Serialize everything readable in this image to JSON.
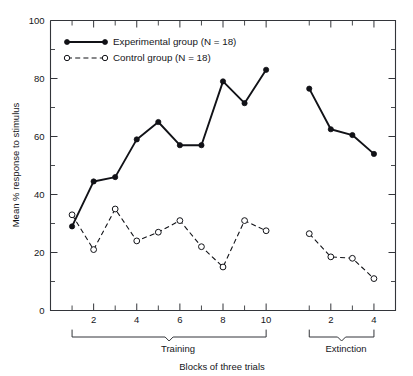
{
  "chart_data": {
    "type": "line",
    "title": "",
    "xlabel": "Blocks of three trials",
    "ylabel": "Mean % response to stimulus",
    "ylim": [
      0,
      100
    ],
    "y_ticks_major": [
      0,
      20,
      40,
      60,
      80,
      100
    ],
    "y_ticks_minor": [
      10,
      30,
      50,
      70,
      90
    ],
    "grid": false,
    "legend_position": "top-left",
    "phases": [
      {
        "name": "Training",
        "blocks": [
          1,
          2,
          3,
          4,
          5,
          6,
          7,
          8,
          9,
          10
        ],
        "labeled_ticks": [
          2,
          4,
          6,
          8,
          10
        ]
      },
      {
        "name": "Extinction",
        "blocks": [
          1,
          2,
          3,
          4
        ],
        "labeled_ticks": [
          2,
          4
        ]
      }
    ],
    "series": [
      {
        "name": "Experimental group (N = 18)",
        "marker": "filled-circle",
        "linestyle": "solid",
        "training_values": [
          29,
          44.5,
          46,
          59,
          65,
          57,
          57,
          79,
          71.5,
          83
        ],
        "extinction_values": [
          76.5,
          62.5,
          60.5,
          54
        ]
      },
      {
        "name": "Control group (N = 18)",
        "marker": "open-circle",
        "linestyle": "dashed",
        "training_values": [
          33,
          21,
          35,
          24,
          27,
          31,
          22,
          15,
          31,
          27.5
        ],
        "extinction_values": [
          26.5,
          18.5,
          18,
          11
        ]
      }
    ]
  },
  "legend": {
    "entries": [
      {
        "label": "Experimental group (N = 18)",
        "marker": "filled-circle",
        "linestyle": "solid"
      },
      {
        "label": "Control group (N = 18)",
        "marker": "open-circle",
        "linestyle": "dashed"
      }
    ]
  },
  "axis": {
    "y_label": "Mean % response to stimulus",
    "x_label": "Blocks of three trials",
    "y_tick_labels": [
      "100",
      "80",
      "60",
      "40",
      "20",
      "0"
    ],
    "x_tick_labels_training": [
      "2",
      "4",
      "6",
      "8",
      "10"
    ],
    "x_tick_labels_extinction": [
      "2",
      "4"
    ]
  },
  "brackets": {
    "training_label": "Training",
    "extinction_label": "Extinction"
  },
  "colors": {
    "line": "#111217",
    "axis": "#33353a",
    "background": "#ffffff",
    "text": "#15161a"
  }
}
